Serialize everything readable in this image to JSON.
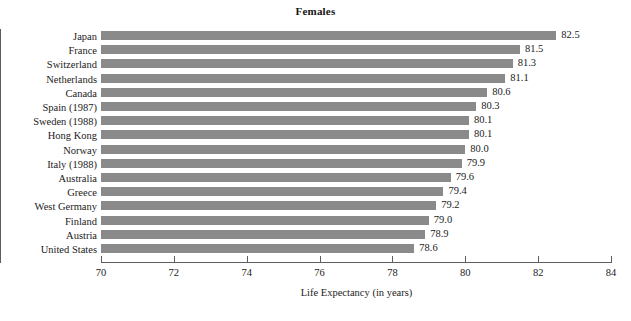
{
  "chart_data": {
    "type": "bar",
    "orientation": "horizontal",
    "title": "Females",
    "xlabel": "Life Expectancy (in years)",
    "ylabel": "",
    "xlim": [
      70,
      84
    ],
    "xticks": [
      70,
      72,
      74,
      76,
      78,
      80,
      82,
      84
    ],
    "xtick_labels": [
      "70",
      "72",
      "74",
      "76",
      "78",
      "80",
      "82",
      "84"
    ],
    "grid": false,
    "legend": false,
    "bar_color": "#8a8a8a",
    "axis_color": "#5e5e5e",
    "background": "#ffffff",
    "categories": [
      "Japan",
      "France",
      "Switzerland",
      "Netherlands",
      "Canada",
      "Spain (1987)",
      "Sweden (1988)",
      "Hong Kong",
      "Norway",
      "Italy (1988)",
      "Australia",
      "Greece",
      "West Germany",
      "Finland",
      "Austria",
      "United States"
    ],
    "values": [
      82.5,
      81.5,
      81.3,
      81.1,
      80.6,
      80.3,
      80.1,
      80.1,
      80.0,
      79.9,
      79.6,
      79.4,
      79.2,
      79.0,
      78.9,
      78.6
    ],
    "value_labels": [
      "82.5",
      "81.5",
      "81.3",
      "81.1",
      "80.6",
      "80.3",
      "80.1",
      "80.1",
      "80.0",
      "79.9",
      "79.6",
      "79.4",
      "79.2",
      "79.0",
      "78.9",
      "78.6"
    ]
  }
}
